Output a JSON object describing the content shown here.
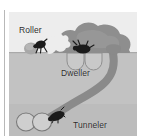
{
  "figure": {
    "type": "illustration"
  },
  "labels": {
    "roller": "Roller",
    "dweller": "Dweller",
    "tunneler": "Tunneler"
  },
  "scene": {
    "sky_label": "above-ground air",
    "soil_label": "soil cross-section",
    "dung_pat_label": "dung pat",
    "ground_line_label": "ground surface"
  },
  "colors": {
    "sky": "#ededed",
    "soil": "#c2c2c2",
    "soil_deep": "#b9b9b9",
    "dung": "#8e8e8e",
    "tunnel": "#8a8a8a",
    "brood_ball": "#cfcfcf",
    "brood_ball_outline": "#7b7b7b",
    "beetle": "#1b1b1b",
    "text": "#2b2b2b",
    "panel_border": "#d4d4d4",
    "gutter_rule": "#b8b8b8"
  },
  "elements": {
    "roller_beetle": "roller-beetle",
    "roller_ball": "dung-ball",
    "dweller_beetle": "dweller-beetle",
    "dweller_chambers": "dweller-brood-chambers",
    "tunneler_beetle": "tunneler-beetle",
    "tunneler_chambers": "tunneler-brood-chambers",
    "tunnel_shaft": "tunnel-shaft",
    "dung_pat": "dung-pat"
  }
}
